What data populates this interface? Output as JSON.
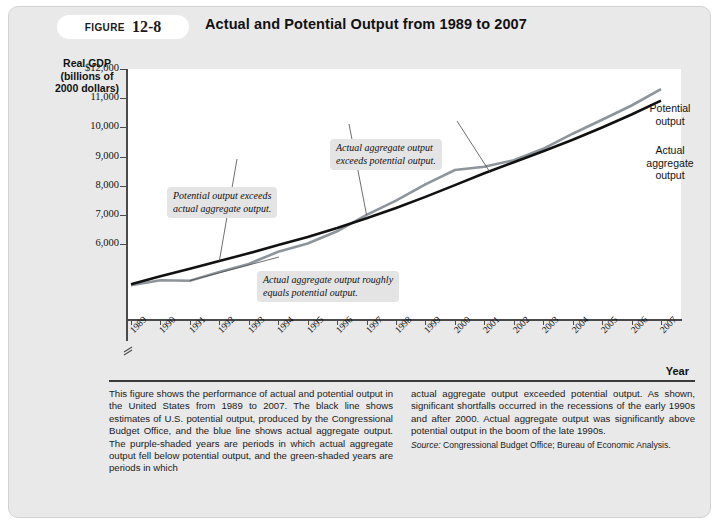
{
  "figure": {
    "badge_word": "FIGURE",
    "badge_number": "12-8",
    "title": "Actual and Potential Output from 1989 to 2007"
  },
  "axes": {
    "y_title": "Real GDP (billions of 2000 dollars)",
    "y_title_line1": "Real GDP",
    "y_title_line2": "(billions of",
    "y_title_line3": "2000 dollars)",
    "x_title": "Year",
    "y_ticks": [
      "$12,000",
      "11,000",
      "10,000",
      "9,000",
      "8,000",
      "7,000",
      "6,000"
    ],
    "x_ticks": [
      "1989",
      "1990",
      "1991",
      "1992",
      "1993",
      "1994",
      "1995",
      "1996",
      "1997",
      "1998",
      "1999",
      "2000",
      "2001",
      "2002",
      "2003",
      "2004",
      "2005",
      "2006",
      "2007"
    ]
  },
  "series_labels": {
    "potential_line1": "Potential",
    "potential_line2": "output",
    "actual_line1": "Actual",
    "actual_line2": "aggregate",
    "actual_line3": "output"
  },
  "annotations": [
    {
      "id": "potential-exceeds-actual",
      "line1": "Potential output exceeds",
      "line2": "actual aggregate output."
    },
    {
      "id": "actual-exceeds-potential",
      "line1": "Actual aggregate output",
      "line2": "exceeds potential output."
    },
    {
      "id": "actual-equals-potential",
      "line1": "Actual aggregate output roughly",
      "line2": "equals potential output."
    }
  ],
  "caption": {
    "left": "This figure shows the performance of actual and potential output in the United States from 1989 to 2007. The black line shows estimates of U.S. potential output, produced by the Congressional Budget Office, and the blue line shows actual aggregate output. The purple-shaded years are periods in which actual aggregate output fell below potential output, and the green-shaded years are periods in which",
    "right": "actual aggregate output exceeded potential output. As shown, significant shortfalls occurred in the recessions of the early 1990s and after 2000. Actual aggregate output was significantly above potential output in the boom of the late 1990s.",
    "source_word": "Source:",
    "source_text": " Congressional Budget Office; Bureau of Economic Analysis."
  },
  "colors": {
    "potential_line": "#111111",
    "actual_line": "#8d949c",
    "card_background": "#e9e9e9",
    "plot_background": "#ffffff",
    "axis": "#4a4a4a",
    "annotation_background": "#e4e4e4"
  },
  "chart_data": {
    "type": "line",
    "title": "Actual and Potential Output from 1989 to 2007",
    "xlabel": "Year",
    "ylabel": "Real GDP (billions of 2000 dollars)",
    "ylim": [
      6000,
      12000
    ],
    "grid": false,
    "legend": "line-end-labels",
    "x": [
      1989,
      1990,
      1991,
      1992,
      1993,
      1994,
      1995,
      1996,
      1997,
      1998,
      1999,
      2000,
      2001,
      2002,
      2003,
      2004,
      2005,
      2006,
      2007
    ],
    "series": [
      {
        "name": "Potential output",
        "color": "#111111",
        "values": [
          6800,
          7000,
          7180,
          7370,
          7560,
          7760,
          7960,
          8180,
          8420,
          8670,
          8940,
          9230,
          9520,
          9790,
          10060,
          10340,
          10640,
          10960,
          11300
        ]
      },
      {
        "name": "Actual aggregate output",
        "color": "#8d949c",
        "values": [
          6780,
          6900,
          6890,
          7100,
          7300,
          7600,
          7800,
          8100,
          8500,
          8850,
          9250,
          9600,
          9680,
          9840,
          10120,
          10490,
          10830,
          11180,
          11580
        ]
      }
    ]
  }
}
